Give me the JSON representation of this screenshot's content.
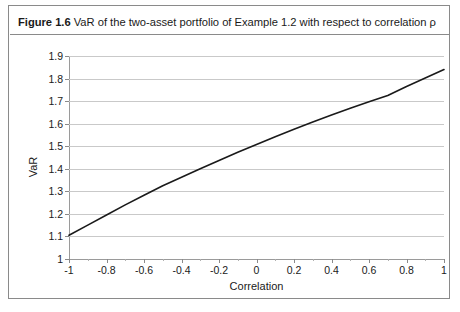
{
  "figure": {
    "label": "Figure 1.6",
    "caption": "VaR of the two-asset portfolio of Example 1.2 with respect to correlation ρ",
    "border_color": "#8a8a8a",
    "background": "#ffffff"
  },
  "chart_data": {
    "type": "line",
    "title": "",
    "xlabel": "Correlation",
    "ylabel": "VaR",
    "xlim": [
      -1,
      1
    ],
    "ylim": [
      1,
      1.9
    ],
    "grid": "horizontal",
    "legend": "none",
    "line_color": "#1a1a1a",
    "x_ticks": [
      -1,
      -0.8,
      -0.6,
      -0.4,
      -0.2,
      0,
      0.2,
      0.4,
      0.6,
      0.8,
      1
    ],
    "x_tick_labels": [
      "-1",
      "-0.8",
      "-0.6",
      "-0.4",
      "-0.2",
      "0",
      "0.2",
      "0.4",
      "0.6",
      "0.8",
      "1"
    ],
    "x_minor_tick_step": 0.1,
    "y_ticks": [
      1,
      1.1,
      1.2,
      1.3,
      1.4,
      1.5,
      1.6,
      1.7,
      1.8,
      1.9
    ],
    "y_tick_labels": [
      "1",
      "1.1",
      "1.2",
      "1.3",
      "1.4",
      "1.5",
      "1.6",
      "1.7",
      "1.8",
      "1.9"
    ],
    "series": [
      {
        "name": "VaR",
        "x": [
          -1,
          -0.9,
          -0.8,
          -0.7,
          -0.6,
          -0.5,
          -0.4,
          -0.3,
          -0.2,
          -0.1,
          0,
          0.1,
          0.2,
          0.3,
          0.4,
          0.5,
          0.6,
          0.7,
          0.8,
          0.9,
          1
        ],
        "values": [
          1.105,
          1.15,
          1.195,
          1.24,
          1.283,
          1.325,
          1.362,
          1.4,
          1.437,
          1.473,
          1.508,
          1.542,
          1.575,
          1.607,
          1.638,
          1.668,
          1.697,
          1.725,
          1.765,
          1.802,
          1.84
        ]
      }
    ]
  }
}
